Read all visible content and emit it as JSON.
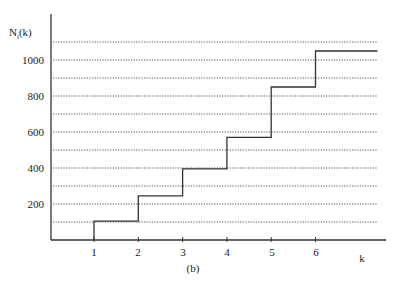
{
  "chart_data": {
    "type": "line",
    "subtype": "step",
    "title": "",
    "caption": "(b)",
    "xlabel": "k",
    "ylabel": "N_i(k)",
    "ylabel_main": "N",
    "ylabel_sub": "i",
    "ylabel_suffix": "(k)",
    "x_ticks": [
      1,
      2,
      3,
      4,
      5,
      6
    ],
    "y_ticks": [
      200,
      400,
      600,
      800,
      1000
    ],
    "ylim": [
      0,
      1100
    ],
    "xlim": [
      0,
      7
    ],
    "grid": {
      "horizontal": true,
      "style": "dotted",
      "values": [
        100,
        200,
        300,
        400,
        500,
        600,
        700,
        800,
        900,
        1000,
        1100
      ]
    },
    "series": [
      {
        "name": "N_i(k)",
        "steps": [
          {
            "k": 1,
            "value": 105
          },
          {
            "k": 2,
            "value": 245
          },
          {
            "k": 3,
            "value": 395
          },
          {
            "k": 4,
            "value": 570
          },
          {
            "k": 5,
            "value": 850
          },
          {
            "k": 6,
            "value": 1050
          }
        ],
        "end_k": 7.4
      }
    ]
  },
  "labels": {
    "ylabel_main": "N",
    "ylabel_sub": "i",
    "ylabel_suffix": "(k)",
    "xlabel": "k",
    "caption": "(b)",
    "ytick_200": "200",
    "ytick_400": "400",
    "ytick_600": "600",
    "ytick_800": "800",
    "ytick_1000": "1000",
    "xtick_1": "1",
    "xtick_2": "2",
    "xtick_3": "3",
    "xtick_4": "4",
    "xtick_5": "5",
    "xtick_6": "6"
  }
}
